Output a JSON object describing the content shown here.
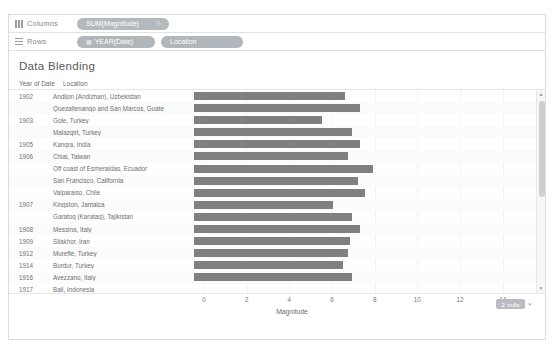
{
  "shelves": {
    "columns": {
      "label": "Columns",
      "icon": "columns-icon",
      "pill": {
        "text": "SUM(Magnitude)",
        "trail": "⠿"
      }
    },
    "rows": {
      "label": "Rows",
      "icon": "rows-icon",
      "pills": [
        {
          "text": "YEAR(Date)",
          "icon": "▦"
        },
        {
          "text": "Location",
          "icon": ""
        }
      ]
    }
  },
  "worksheet": {
    "title": "Data Blending"
  },
  "table": {
    "headers": {
      "year": "Year of Date",
      "location": "Location"
    }
  },
  "axis": {
    "title": "Magnitude",
    "ticks": [
      "0",
      "2",
      "4",
      "6",
      "8",
      "10",
      "12",
      "14"
    ]
  },
  "nulls": {
    "label": "2 nulls",
    "caret": "▾"
  },
  "scrollbar": {
    "up": "▲",
    "down": "▼"
  },
  "chart_data": {
    "type": "bar",
    "title": "Data Blending",
    "xlabel": "Magnitude",
    "ylabel": "",
    "xlim": [
      0,
      15
    ],
    "orientation": "horizontal",
    "grid": true,
    "legend": null,
    "bar_color": "#808080",
    "null_count": 2,
    "categories": [
      "Andijon (Andizhan), Uzbekistan",
      "Quezaltenango and San Marcos, Guate",
      "Gole, Turkey",
      "Malazgirt, Turkey",
      "Kangra, India",
      "Chiai, Taiwan",
      "Off coast of Esmeraldas, Ecuador",
      "San Francisco, California",
      "Valparaiso, Chile",
      "Kingston, Jamaica",
      "Garatog (Karatag), Tajikistan",
      "Messina, Italy",
      "Silakhor, Iran",
      "Murefte, Turkey",
      "Burdur, Turkey",
      "Avezzano, Italy",
      "Bali, Indonesia",
      "North of Daguan, Yunnan, China",
      "Nan'ao, Guangdong (Kwangtung), China"
    ],
    "values": [
      7.1,
      7.8,
      6.0,
      7.4,
      7.8,
      7.2,
      8.4,
      7.7,
      8.0,
      6.5,
      7.4,
      7.8,
      7.3,
      7.2,
      7.0,
      7.4,
      null,
      7.3,
      7.3
    ],
    "years": [
      "1902",
      "",
      "1903",
      "",
      "1905",
      "1906",
      "",
      "",
      "",
      "1907",
      "",
      "1908",
      "1909",
      "1912",
      "1914",
      "1916",
      "1917",
      "",
      "1918"
    ],
    "rows": [
      {
        "year": "1902",
        "location": "Andijon (Andizhan), Uzbekistan",
        "value": 7.1
      },
      {
        "year": "",
        "location": "Quezaltenango and San Marcos, Guate",
        "value": 7.8
      },
      {
        "year": "1903",
        "location": "Gole, Turkey",
        "value": 6.0
      },
      {
        "year": "",
        "location": "Malazgirt, Turkey",
        "value": 7.4
      },
      {
        "year": "1905",
        "location": "Kangra, India",
        "value": 7.8
      },
      {
        "year": "1906",
        "location": "Chiai, Taiwan",
        "value": 7.2
      },
      {
        "year": "",
        "location": "Off coast of Esmeraldas, Ecuador",
        "value": 8.4
      },
      {
        "year": "",
        "location": "San Francisco, California",
        "value": 7.7
      },
      {
        "year": "",
        "location": "Valparaiso, Chile",
        "value": 8.0
      },
      {
        "year": "1907",
        "location": "Kingston, Jamaica",
        "value": 6.5
      },
      {
        "year": "",
        "location": "Garatog (Karatag), Tajikistan",
        "value": 7.4
      },
      {
        "year": "1908",
        "location": "Messina, Italy",
        "value": 7.8
      },
      {
        "year": "1909",
        "location": "Silakhor, Iran",
        "value": 7.3
      },
      {
        "year": "1912",
        "location": "Murefte, Turkey",
        "value": 7.2
      },
      {
        "year": "1914",
        "location": "Burdur, Turkey",
        "value": 7.0
      },
      {
        "year": "1916",
        "location": "Avezzano, Italy",
        "value": 7.4
      },
      {
        "year": "1917",
        "location": "Bali, Indonesia",
        "value": null
      },
      {
        "year": "",
        "location": "North of Daguan, Yunnan, China",
        "value": 7.3
      },
      {
        "year": "1918",
        "location": "Nan'ao, Guangdong (Kwangtung), China",
        "value": 7.3
      }
    ]
  }
}
